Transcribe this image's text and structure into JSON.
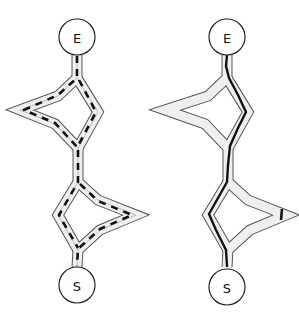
{
  "diagram": {
    "type": "path-comparison",
    "panels": [
      {
        "id": "left",
        "start_label": "S",
        "end_label": "E",
        "route_style": "dashed",
        "description": "Route explores both branches of each loop (multiple dashed paths)"
      },
      {
        "id": "right",
        "start_label": "S",
        "end_label": "E",
        "route_style": "solid",
        "description": "Route follows a single direct path through the right/left inner branches"
      }
    ],
    "colors": {
      "corridor_border": "#555555",
      "corridor_fill": "#efefef",
      "route": "#111111",
      "background": "#ffffff"
    }
  }
}
